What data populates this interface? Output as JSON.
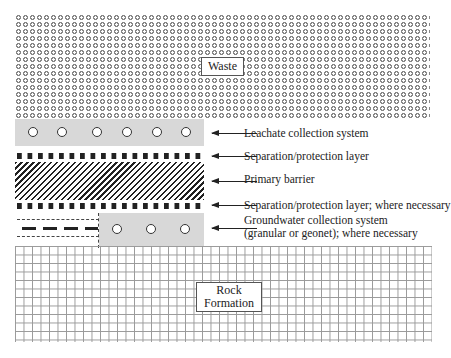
{
  "diagram": {
    "type": "landfill liner cross-section",
    "layers": {
      "waste": {
        "label": "Waste"
      },
      "leachate": {
        "caption": "Leachate collection system",
        "pipe_count": 6
      },
      "separation_top": {
        "caption": "Separation/protection layer"
      },
      "primary_barrier": {
        "caption": "Primary barrier"
      },
      "separation_bottom": {
        "caption": "Separation/protection layer; where necessary"
      },
      "groundwater": {
        "caption_line1": "Groundwater collection system",
        "caption_line2": "(granular or geonet); where necessary",
        "pipe_count": 3
      },
      "rock": {
        "label_line1": "Rock",
        "label_line2": "Formation"
      }
    },
    "colors": {
      "fill_gray": "#d8d8d8",
      "ink": "#222222",
      "grid": "#999999"
    }
  }
}
